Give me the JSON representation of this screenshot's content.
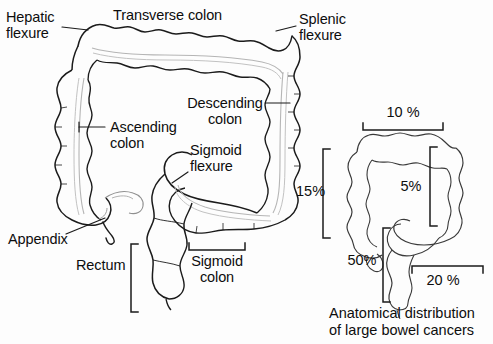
{
  "figure": {
    "background_color": "#fdfdfd",
    "ink_color": "#111111",
    "lumen_color": "#b9b9b9"
  },
  "main_diagram": {
    "name": "large-bowel-anatomy",
    "labels": [
      {
        "id": "hepatic-flexure",
        "line1": "Hepatic",
        "line2": "flexure",
        "x": 6,
        "y": 10,
        "align": "left"
      },
      {
        "id": "transverse-colon",
        "line1": "Transverse colon",
        "line2": "",
        "x": 113,
        "y": 8,
        "align": "left"
      },
      {
        "id": "splenic-flexure",
        "line1": "Splenic",
        "line2": "flexure",
        "x": 299,
        "y": 12,
        "align": "left"
      },
      {
        "id": "descending-colon",
        "line1": "Descending",
        "line2": "colon",
        "x": 186,
        "y": 96,
        "align": "left"
      },
      {
        "id": "ascending-colon",
        "line1": "Ascending",
        "line2": "colon",
        "x": 110,
        "y": 120,
        "align": "left"
      },
      {
        "id": "sigmoid-flexure",
        "line1": "Sigmoid",
        "line2": "flexure",
        "x": 190,
        "y": 143,
        "align": "left"
      },
      {
        "id": "appendix",
        "line1": "Appendix",
        "line2": "",
        "x": 8,
        "y": 232,
        "align": "left"
      },
      {
        "id": "rectum",
        "line1": "Rectum",
        "line2": "",
        "x": 76,
        "y": 258,
        "align": "left"
      },
      {
        "id": "sigmoid-colon",
        "line1": "Sigmoid",
        "line2": "colon",
        "x": 188,
        "y": 254,
        "align": "left"
      }
    ]
  },
  "distribution_diagram": {
    "name": "cancer-distribution",
    "caption_line1": "Anatomical distribution",
    "caption_line2": "of large bowel cancers",
    "percentages": [
      {
        "id": "transverse-pct",
        "value": "10 %",
        "region": "transverse colon",
        "x": 402,
        "y": 106,
        "align": "center"
      },
      {
        "id": "descending-pct",
        "value": "5%",
        "region": "descending colon",
        "x": 411,
        "y": 180,
        "align": "center"
      },
      {
        "id": "rectum-pct",
        "value": "50%",
        "region": "rectum",
        "x": 368,
        "y": 252,
        "align": "center"
      },
      {
        "id": "sigmoid-pct",
        "value": "20 %",
        "region": "sigmoid colon",
        "x": 435,
        "y": 272,
        "align": "center"
      }
    ]
  },
  "main_percentage": {
    "id": "ascending-left-pct",
    "value": "15%",
    "x": 296,
    "y": 183
  }
}
